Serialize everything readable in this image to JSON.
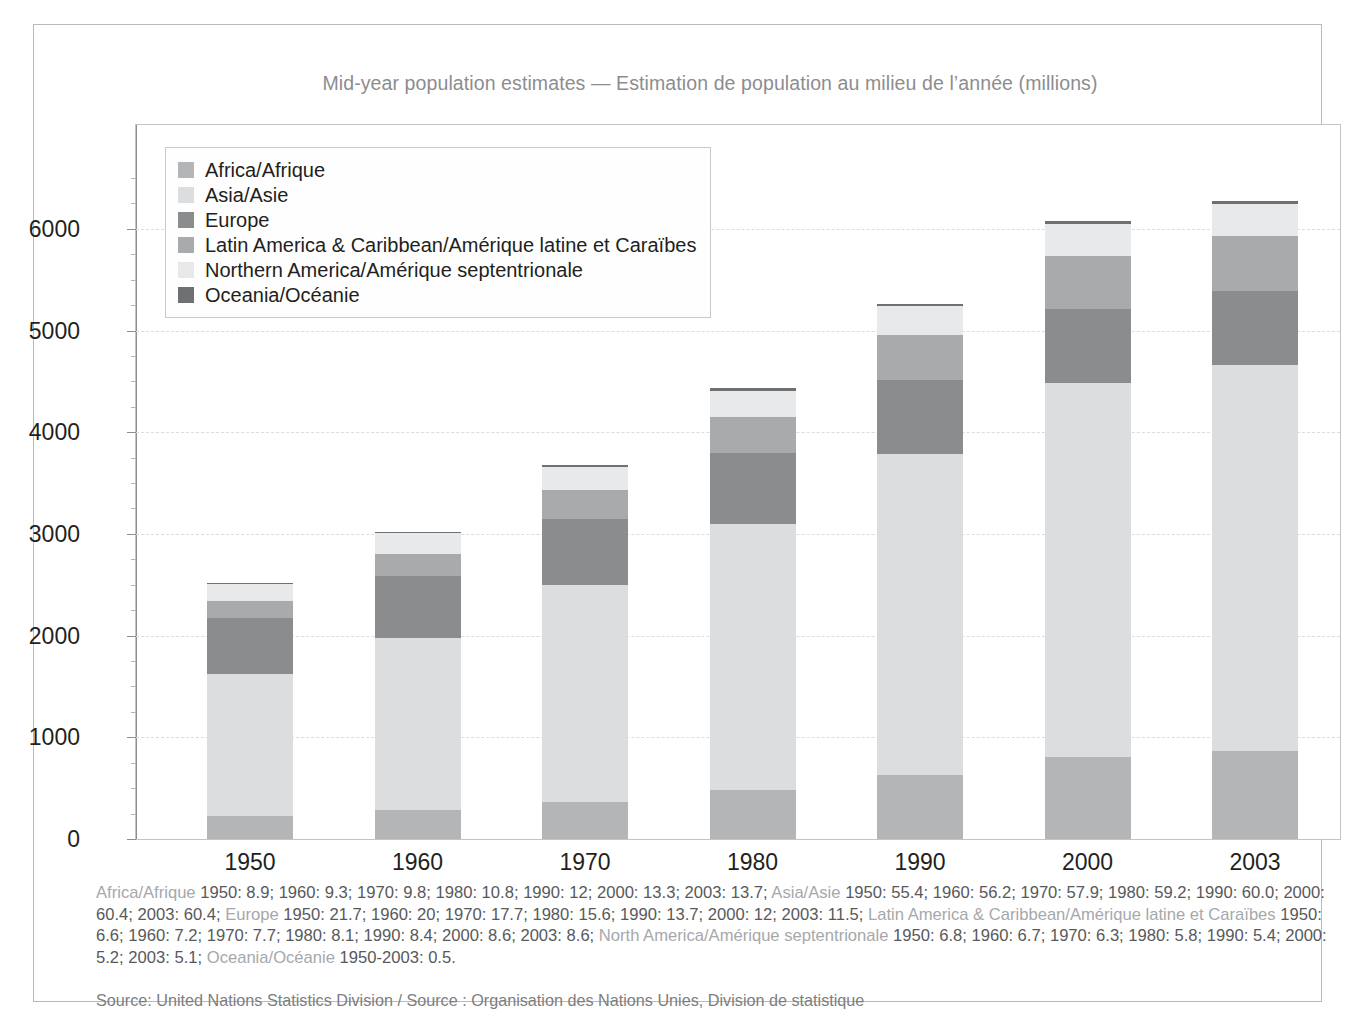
{
  "title": "Mid-year population estimates — Estimation de population au milieu de l’année (millions)",
  "colors": {
    "africa": "#b4b5b7",
    "asia": "#dcdddf",
    "europe": "#8a8c8e",
    "latin_america": "#a8aaac",
    "northern_america": "#e8e9ea",
    "oceania": "#6e7072",
    "axis": "#231f20",
    "grid": "#d9dde3",
    "frame": "#b9babc",
    "caption_text": "#58595b",
    "caption_name": "#a6a8ab",
    "title_text": "#8c8d8f"
  },
  "legend": {
    "items": [
      {
        "label": "Africa/Afrique",
        "key": "africa"
      },
      {
        "label": "Asia/Asie",
        "key": "asia"
      },
      {
        "label": "Europe",
        "key": "europe"
      },
      {
        "label": "Latin America & Caribbean/Amérique latine et Caraïbes",
        "key": "latin_america"
      },
      {
        "label": "Northern America/Amérique septentrionale",
        "key": "northern_america"
      },
      {
        "label": "Oceania/Océanie",
        "key": "oceania"
      }
    ]
  },
  "caption": {
    "segments": [
      {
        "name": "Africa/Afrique ",
        "values": "1950: 8.9; 1960: 9.3; 1970: 9.8; 1980: 10.8; 1990: 12; 2000: 13.3; 2003: 13.7; "
      },
      {
        "name": "Asia/Asie ",
        "values": "1950: 55.4; 1960: 56.2; 1970: 57.9; 1980: 59.2; 1990: 60.0; 2000: 60.4; 2003: 60.4; "
      },
      {
        "name": "Europe ",
        "values": "1950: 21.7; 1960: 20; 1970: 17.7; 1980: 15.6; 1990: 13.7; 2000: 12; 2003: 11.5; "
      },
      {
        "name": "Latin America & Caribbean/Amérique latine et Caraïbes ",
        "values": "1950: 6.6; 1960: 7.2; 1970: 7.7; 1980: 8.1; 1990: 8.4; 2000: 8.6; 2003: 8.6; "
      },
      {
        "name": "North America/Amérique septentrionale ",
        "values": "1950: 6.8; 1960: 6.7; 1970: 6.3; 1980: 5.8; 1990: 5.4; 2000: 5.2; 2003: 5.1; "
      },
      {
        "name": "Oceania/Océanie ",
        "values": "1950-2003: 0.5."
      }
    ]
  },
  "source": "Source:  United Nations Statistics Division / Source :  Organisation des Nations Unies, Division de statistique",
  "chart_data": {
    "type": "bar",
    "stacked": true,
    "title": "Mid-year population estimates — Estimation de population au milieu de l’année (millions)",
    "xlabel": "",
    "ylabel": "",
    "ylim": [
      0,
      6700
    ],
    "yticks": [
      0,
      1000,
      2000,
      3000,
      4000,
      5000,
      6000
    ],
    "ytick_labels": [
      "0",
      "1000",
      "2000",
      "3000",
      "4000",
      "5000",
      "6000"
    ],
    "minor_tick_step": 250,
    "grid": true,
    "grid_style": "dashed",
    "legend_position": "top-left inside",
    "unit": "millions",
    "categories": [
      "1950",
      "1960",
      "1970",
      "1980",
      "1990",
      "2000",
      "2003"
    ],
    "totals": [
      2523,
      3025,
      3684,
      4430,
      5264,
      6079,
      6290
    ],
    "series": [
      {
        "name": "Africa/Afrique",
        "key": "africa",
        "values": [
          225,
          281,
          361,
          478,
          632,
          808,
          862
        ],
        "percent": [
          8.9,
          9.3,
          9.8,
          10.8,
          12.0,
          13.3,
          13.7
        ]
      },
      {
        "name": "Asia/Asie",
        "key": "asia",
        "values": [
          1398,
          1700,
          2133,
          2623,
          3158,
          3672,
          3799
        ],
        "percent": [
          55.4,
          56.2,
          57.9,
          59.2,
          60.0,
          60.4,
          60.4
        ]
      },
      {
        "name": "Europe",
        "key": "europe",
        "values": [
          547,
          605,
          652,
          691,
          721,
          729,
          723
        ],
        "percent": [
          21.7,
          20.0,
          17.7,
          15.6,
          13.7,
          12.0,
          11.5
        ]
      },
      {
        "name": "Latin America & Caribbean/Amérique latine et Caraïbes",
        "key": "latin_america",
        "values": [
          167,
          218,
          284,
          359,
          442,
          523,
          541
        ],
        "percent": [
          6.6,
          7.2,
          7.7,
          8.1,
          8.4,
          8.6,
          8.6
        ]
      },
      {
        "name": "Northern America/Amérique septentrionale",
        "key": "northern_america",
        "values": [
          172,
          203,
          232,
          257,
          284,
          316,
          321
        ],
        "percent": [
          6.8,
          6.7,
          6.3,
          5.8,
          5.4,
          5.2,
          5.1
        ]
      },
      {
        "name": "Oceania/Océanie",
        "key": "oceania",
        "values": [
          13,
          16,
          19,
          23,
          26,
          31,
          32
        ],
        "percent": [
          0.5,
          0.5,
          0.5,
          0.5,
          0.5,
          0.5,
          0.5
        ]
      }
    ]
  }
}
